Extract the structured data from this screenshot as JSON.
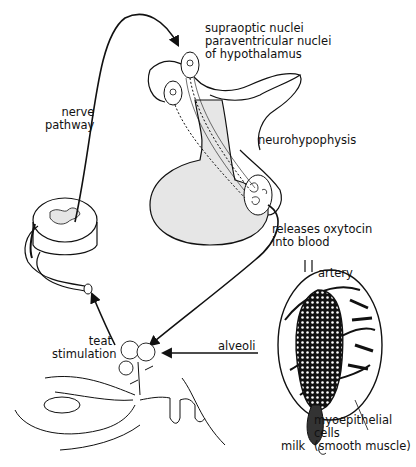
{
  "diagram": {
    "type": "milk-ejection reflex (oxytocin pathway)",
    "labels": {
      "hypothalamus": [
        "supraoptic nuclei",
        "paraventricular nuclei",
        "of hypothalamus"
      ],
      "nerve_pathway": [
        "nerve",
        "pathway"
      ],
      "neurohypophysis": "neurohypophysis",
      "oxytocin": [
        "releases oxytocin",
        "into blood"
      ],
      "artery": "artery",
      "alveoli": "alveoli",
      "teat_stimulation": [
        "teat",
        "stimulation"
      ],
      "myoepithelial": [
        "myoepithelial",
        "cells",
        "(smooth muscle)"
      ],
      "milk": "milk"
    },
    "colors": {
      "line": "#111111",
      "fill_gray": "#e6e6e6",
      "background": "#ffffff"
    }
  }
}
